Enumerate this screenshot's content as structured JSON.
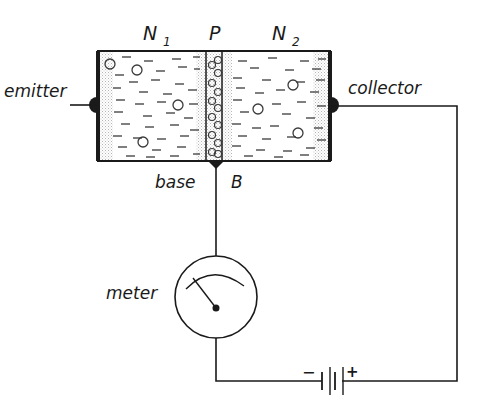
{
  "diagram": {
    "regions": [
      {
        "id": "N1",
        "label": "N",
        "subscript": "1"
      },
      {
        "id": "P",
        "label": "P",
        "subscript": ""
      },
      {
        "id": "N2",
        "label": "N",
        "subscript": "2"
      }
    ],
    "labels": {
      "emitter": "emitter",
      "collector": "collector",
      "base": "base",
      "base_letter": "B",
      "meter": "meter"
    },
    "battery": {
      "minus": "−",
      "plus": "+"
    },
    "colors": {
      "ink": "#1a1a1a",
      "stipple": "#c8c8c8",
      "background": "#ffffff"
    }
  }
}
